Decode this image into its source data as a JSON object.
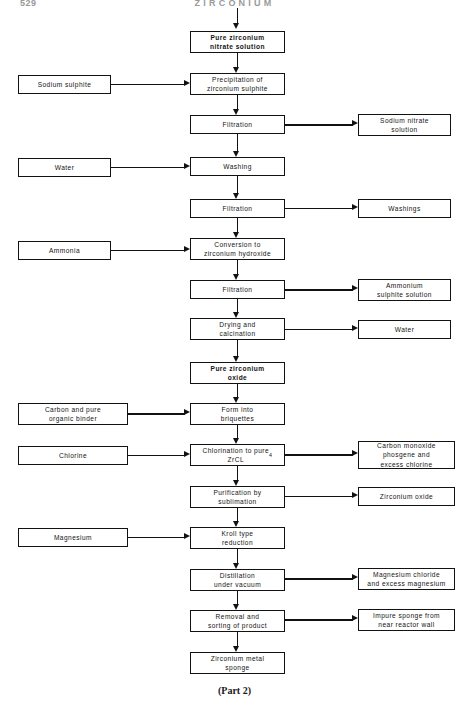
{
  "page": {
    "folio": "529",
    "running_head": "ZIRCONIUM",
    "caption": "(Part 2)"
  },
  "diagram": {
    "type": "process-flowchart",
    "columns": {
      "inputs": "left",
      "process": "center",
      "outputs": "right"
    },
    "process_steps": [
      {
        "id": "p1",
        "label": "Pure zirconium\nnitrate solution",
        "emphasis": true,
        "x": 190,
        "y": 31,
        "w": 95,
        "h": 22
      },
      {
        "id": "p2",
        "label": "Precipitation  of\nzirconium  sulphite",
        "emphasis": false,
        "x": 190,
        "y": 73,
        "w": 95,
        "h": 22
      },
      {
        "id": "p3",
        "label": "Filtration",
        "emphasis": false,
        "x": 190,
        "y": 115,
        "w": 95,
        "h": 19
      },
      {
        "id": "p4",
        "label": "Washing",
        "emphasis": false,
        "x": 190,
        "y": 157,
        "w": 95,
        "h": 19
      },
      {
        "id": "p5",
        "label": "Filtration",
        "emphasis": false,
        "x": 190,
        "y": 199,
        "w": 95,
        "h": 19
      },
      {
        "id": "p6",
        "label": "Conversion  to\nzirconium  hydroxide",
        "emphasis": false,
        "x": 190,
        "y": 238,
        "w": 95,
        "h": 22
      },
      {
        "id": "p7",
        "label": "Filtration",
        "emphasis": false,
        "x": 190,
        "y": 280,
        "w": 95,
        "h": 19
      },
      {
        "id": "p8",
        "label": "Drying and\ncalcination",
        "emphasis": false,
        "x": 190,
        "y": 318,
        "w": 95,
        "h": 22
      },
      {
        "id": "p9",
        "label": "Pure zirconium\noxide",
        "emphasis": true,
        "x": 190,
        "y": 362,
        "w": 95,
        "h": 22
      },
      {
        "id": "p10",
        "label": "Form  into\nbriquettes",
        "emphasis": false,
        "x": 190,
        "y": 403,
        "w": 95,
        "h": 22
      },
      {
        "id": "p11",
        "label": "Chlorination to pure\nZrCL4",
        "emphasis": false,
        "x": 190,
        "y": 444,
        "w": 95,
        "h": 22,
        "subscript": "4"
      },
      {
        "id": "p12",
        "label": "Purification   by\nsublimation",
        "emphasis": false,
        "x": 190,
        "y": 486,
        "w": 95,
        "h": 22
      },
      {
        "id": "p13",
        "label": "Kroll type\nreduction",
        "emphasis": false,
        "x": 190,
        "y": 527,
        "w": 95,
        "h": 22
      },
      {
        "id": "p14",
        "label": "Distillation\nunder vacuum",
        "emphasis": false,
        "x": 190,
        "y": 569,
        "w": 95,
        "h": 22
      },
      {
        "id": "p15",
        "label": "Removal and\nsorting of product",
        "emphasis": false,
        "x": 190,
        "y": 610,
        "w": 95,
        "h": 22
      },
      {
        "id": "p16",
        "label": "Zirconium   metal\nsponge",
        "emphasis": false,
        "x": 190,
        "y": 652,
        "w": 95,
        "h": 22
      }
    ],
    "inputs": [
      {
        "id": "i1",
        "label": "Sodium sulphite",
        "target": "p2",
        "x": 18,
        "y": 75,
        "w": 93,
        "h": 19
      },
      {
        "id": "i2",
        "label": "Water",
        "target": "p4",
        "x": 18,
        "y": 158,
        "w": 93,
        "h": 19
      },
      {
        "id": "i3",
        "label": "Ammonia",
        "target": "p6",
        "x": 18,
        "y": 241,
        "w": 93,
        "h": 19
      },
      {
        "id": "i4",
        "label": "Carbon and pure\norganic binder",
        "target": "p10",
        "x": 18,
        "y": 403,
        "w": 110,
        "h": 22
      },
      {
        "id": "i5",
        "label": "Chlorine",
        "target": "p11",
        "x": 18,
        "y": 446,
        "w": 110,
        "h": 19
      },
      {
        "id": "i6",
        "label": "Magnesium",
        "target": "p13",
        "x": 18,
        "y": 528,
        "w": 110,
        "h": 19
      }
    ],
    "outputs": [
      {
        "id": "o1",
        "label": "Sodium nitrate\nsolution",
        "source": "p3",
        "x": 358,
        "y": 114,
        "w": 93,
        "h": 22
      },
      {
        "id": "o2",
        "label": "Washings",
        "source": "p5",
        "x": 358,
        "y": 199,
        "w": 93,
        "h": 19
      },
      {
        "id": "o3",
        "label": "Ammonium\nsulphite solution",
        "source": "p7",
        "x": 358,
        "y": 279,
        "w": 93,
        "h": 22
      },
      {
        "id": "o4",
        "label": "Water",
        "source": "p8",
        "x": 358,
        "y": 320,
        "w": 93,
        "h": 19
      },
      {
        "id": "o5",
        "label": "Carbon  monoxide\nphosgene and\nexcess chlorine",
        "source": "p11",
        "x": 358,
        "y": 441,
        "w": 97,
        "h": 28
      },
      {
        "id": "o6",
        "label": "Zirconium oxide",
        "source": "p12",
        "x": 358,
        "y": 487,
        "w": 97,
        "h": 19
      },
      {
        "id": "o7",
        "label": "Magnesium chloride\nand excess magnesium",
        "source": "p14",
        "x": 358,
        "y": 568,
        "w": 97,
        "h": 22
      },
      {
        "id": "o8",
        "label": "Impure sponge from\nnear reactor  wall",
        "source": "p15",
        "x": 358,
        "y": 609,
        "w": 97,
        "h": 22
      }
    ]
  }
}
